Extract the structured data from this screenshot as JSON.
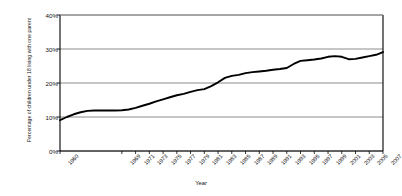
{
  "chart_data": {
    "type": "line",
    "title": "",
    "xlabel": "Year",
    "ylabel": "Percentage of children under 18 living with one parent",
    "ylim": [
      0,
      40
    ],
    "ytick_labels": [
      "0%",
      "10%",
      "20%",
      "30%",
      "40%"
    ],
    "ytick_values": [
      0,
      10,
      20,
      30,
      40
    ],
    "grid": "horizontal",
    "legend": "none",
    "line_color": "#000000",
    "gridline_color": "#808080",
    "axis_color": "#000000",
    "xtick_labels": [
      "1960",
      "1969",
      "1971",
      "1973",
      "1975",
      "1977",
      "1979",
      "1981",
      "1983",
      "1985",
      "1987",
      "1989",
      "1991",
      "1993",
      "1995",
      "1997",
      "1999",
      "2001",
      "2003",
      "2005",
      "2007"
    ],
    "x": [
      1960,
      1961,
      1962,
      1963,
      1964,
      1965,
      1966,
      1967,
      1968,
      1969,
      1970,
      1971,
      1972,
      1973,
      1974,
      1975,
      1976,
      1977,
      1978,
      1979,
      1980,
      1981,
      1982,
      1983,
      1984,
      1985,
      1986,
      1987,
      1988,
      1989,
      1990,
      1991,
      1992,
      1993,
      1994,
      1995,
      1996,
      1997,
      1998,
      1999,
      2000,
      2001,
      2002,
      2003,
      2004,
      2005,
      2006,
      2007
    ],
    "values": [
      9.1,
      10.0,
      10.8,
      11.4,
      11.8,
      11.9,
      11.9,
      11.9,
      11.9,
      12.0,
      12.2,
      12.7,
      13.3,
      13.9,
      14.6,
      15.2,
      15.8,
      16.4,
      16.8,
      17.4,
      17.9,
      18.2,
      19.1,
      20.2,
      21.5,
      22.1,
      22.4,
      22.9,
      23.2,
      23.4,
      23.6,
      23.9,
      24.1,
      24.4,
      25.6,
      26.5,
      26.7,
      26.9,
      27.2,
      27.7,
      27.9,
      27.7,
      27.0,
      27.1,
      27.5,
      27.9,
      28.3,
      29.1
    ]
  }
}
